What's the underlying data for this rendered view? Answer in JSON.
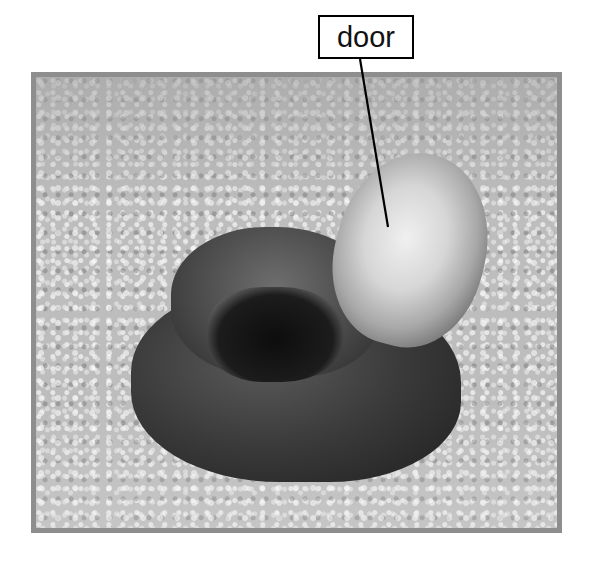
{
  "figure": {
    "annotations": [
      {
        "label": "door"
      }
    ]
  }
}
